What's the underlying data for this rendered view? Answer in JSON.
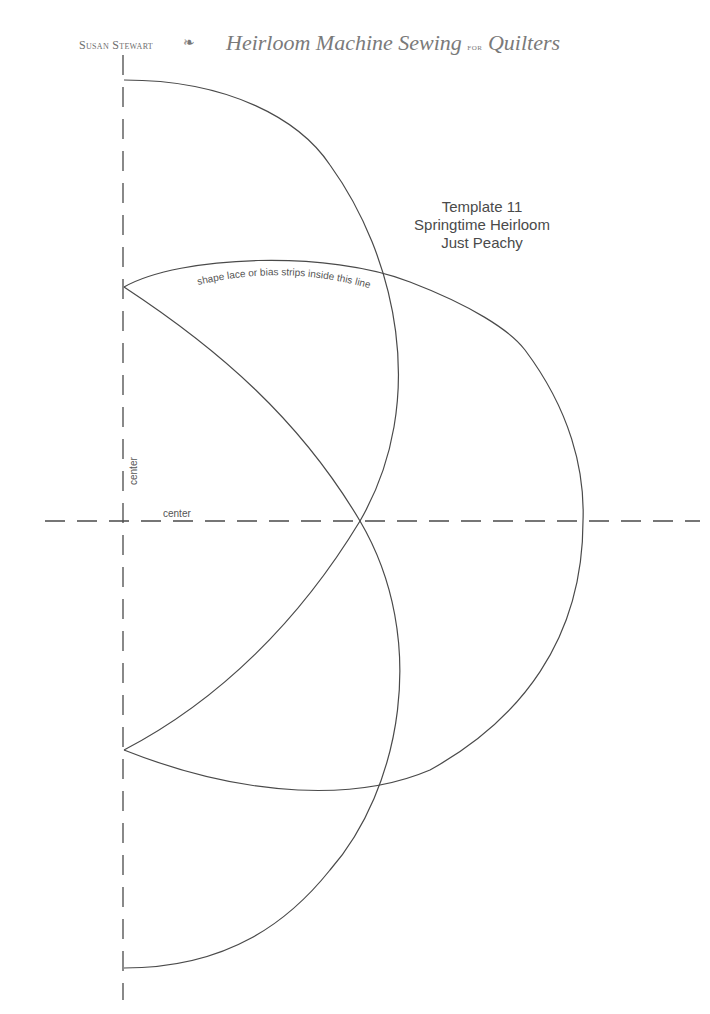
{
  "header": {
    "author": "Susan Stewart",
    "separator_glyph": "ornament-flourish",
    "book_title_part1": "Heirloom Machine Sewing",
    "book_title_for": "for",
    "book_title_part2": "Quilters"
  },
  "template": {
    "line1": "Template 11",
    "line2": "Springtime Heirloom",
    "line3": "Just Peachy"
  },
  "labels": {
    "lace_instruction": "shape lace or bias strips inside this line",
    "vertical_center": "center",
    "horizontal_center": "center"
  },
  "colors": {
    "line": "#4a4a4a",
    "text": "#555555",
    "header_text": "#6e6e6e"
  }
}
